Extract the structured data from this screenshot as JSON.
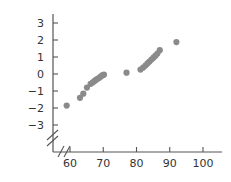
{
  "chart_data": {
    "type": "scatter",
    "title": "",
    "xlabel": "",
    "ylabel": "",
    "xlim": [
      55,
      103
    ],
    "ylim": [
      -3.6,
      3.6
    ],
    "grid": false,
    "legend": null,
    "axis_break_x": true,
    "axis_break_y": true,
    "xticks": [
      60,
      70,
      80,
      90,
      100
    ],
    "yticks": [
      3,
      2,
      1,
      0,
      -1,
      -2,
      -3
    ],
    "xtick_labels": [
      "60",
      "70",
      "80",
      "90",
      "100"
    ],
    "ytick_labels": [
      "3",
      "2",
      "1",
      "0",
      "−1",
      "−2",
      "−3"
    ],
    "marker_color": "#8a8a8a",
    "marker_size": 3.1,
    "points": [
      {
        "x": 59.0,
        "y": -1.86
      },
      {
        "x": 63.0,
        "y": -1.4
      },
      {
        "x": 64.0,
        "y": -1.16
      },
      {
        "x": 65.1,
        "y": -0.8
      },
      {
        "x": 66.2,
        "y": -0.58
      },
      {
        "x": 66.8,
        "y": -0.5
      },
      {
        "x": 67.3,
        "y": -0.42
      },
      {
        "x": 67.8,
        "y": -0.35
      },
      {
        "x": 68.3,
        "y": -0.28
      },
      {
        "x": 68.8,
        "y": -0.22
      },
      {
        "x": 69.3,
        "y": -0.14
      },
      {
        "x": 69.8,
        "y": -0.07
      },
      {
        "x": 70.2,
        "y": -0.04
      },
      {
        "x": 77.0,
        "y": 0.08
      },
      {
        "x": 81.2,
        "y": 0.26
      },
      {
        "x": 82.0,
        "y": 0.38
      },
      {
        "x": 82.7,
        "y": 0.5
      },
      {
        "x": 83.3,
        "y": 0.62
      },
      {
        "x": 83.9,
        "y": 0.73
      },
      {
        "x": 84.5,
        "y": 0.85
      },
      {
        "x": 85.1,
        "y": 0.96
      },
      {
        "x": 85.7,
        "y": 1.08
      },
      {
        "x": 86.3,
        "y": 1.2
      },
      {
        "x": 87.0,
        "y": 1.4
      },
      {
        "x": 92.0,
        "y": 1.88
      }
    ]
  }
}
